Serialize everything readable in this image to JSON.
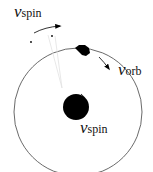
{
  "diagram": {
    "labels": {
      "spin_top": {
        "symbol": "v",
        "subscript": "spin"
      },
      "orbital": {
        "symbol": "v",
        "subscript": "orb"
      },
      "spin_center": {
        "symbol": "v",
        "subscript": "spin"
      }
    },
    "colors": {
      "stroke": "#333333",
      "fill": "#000000",
      "guide": "#dddddd"
    }
  }
}
